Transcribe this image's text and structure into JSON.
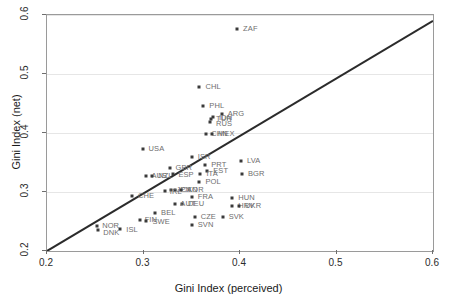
{
  "chart_data": {
    "type": "scatter",
    "title": "",
    "xlabel": "Gini Index (perceived)",
    "ylabel": "Gini Index (net)",
    "xlim": [
      0.2,
      0.6
    ],
    "ylim": [
      0.2,
      0.6
    ],
    "xticks": [
      "0.2",
      "0.3",
      "0.4",
      "0.5",
      "0.6"
    ],
    "yticks": [
      "0.2",
      "0.3",
      "0.4",
      "0.5",
      "0.6"
    ],
    "xtick_values": [
      0.2,
      0.3,
      0.4,
      0.5,
      0.6
    ],
    "ytick_values": [
      0.2,
      0.3,
      0.4,
      0.5,
      0.6
    ],
    "grid": "horizontal",
    "legend": "none",
    "marker_color": "#3a3a3a",
    "label_color": "#6e6e6e",
    "gridline_color": "#e6e6e6",
    "reference_line": {
      "name": "identity-line",
      "type": "45-degree",
      "from": [
        0.2,
        0.2
      ],
      "to": [
        0.6,
        0.59
      ],
      "color": "#2b2b2b"
    },
    "points": [
      {
        "label": "ZAF",
        "x": 0.397,
        "y": 0.576,
        "lx": 6,
        "ly": -4
      },
      {
        "label": "CHL",
        "x": 0.358,
        "y": 0.478,
        "lx": 6,
        "ly": -4
      },
      {
        "label": "PHL",
        "x": 0.362,
        "y": 0.446,
        "lx": 6,
        "ly": -4
      },
      {
        "label": "ARG",
        "x": 0.381,
        "y": 0.432,
        "lx": 6,
        "ly": -4
      },
      {
        "label": "IDN",
        "x": 0.372,
        "y": 0.427,
        "lx": 6,
        "ly": -3
      },
      {
        "label": "TUR",
        "x": 0.37,
        "y": 0.424,
        "lx": 5,
        "ly": -4
      },
      {
        "label": "RUS",
        "x": 0.369,
        "y": 0.419,
        "lx": 6,
        "ly": -2
      },
      {
        "label": "CHN",
        "x": 0.365,
        "y": 0.398,
        "lx": 5,
        "ly": -4
      },
      {
        "label": "MEX",
        "x": 0.371,
        "y": 0.398,
        "lx": 6,
        "ly": -4
      },
      {
        "label": "USA",
        "x": 0.299,
        "y": 0.373,
        "lx": 6,
        "ly": -4
      },
      {
        "label": "ISR",
        "x": 0.35,
        "y": 0.36,
        "lx": 6,
        "ly": -4
      },
      {
        "label": "LVA",
        "x": 0.401,
        "y": 0.352,
        "lx": 6,
        "ly": -4
      },
      {
        "label": "PRT",
        "x": 0.364,
        "y": 0.345,
        "lx": 6,
        "ly": -4
      },
      {
        "label": "GBR",
        "x": 0.327,
        "y": 0.341,
        "lx": 6,
        "ly": -4
      },
      {
        "label": "EST",
        "x": 0.366,
        "y": 0.336,
        "lx": 6,
        "ly": -4
      },
      {
        "label": "ITA",
        "x": 0.359,
        "y": 0.331,
        "lx": 6,
        "ly": -4
      },
      {
        "label": "BGR",
        "x": 0.402,
        "y": 0.33,
        "lx": 6,
        "ly": -4
      },
      {
        "label": "ESP",
        "x": 0.331,
        "y": 0.331,
        "lx": 5,
        "ly": -3
      },
      {
        "label": "AUS",
        "x": 0.303,
        "y": 0.327,
        "lx": 5,
        "ly": -4
      },
      {
        "label": "NZL",
        "x": 0.309,
        "y": 0.327,
        "lx": 6,
        "ly": -4
      },
      {
        "label": "POL",
        "x": 0.358,
        "y": 0.317,
        "lx": 6,
        "ly": -4
      },
      {
        "label": "JPN",
        "x": 0.329,
        "y": 0.303,
        "lx": 5,
        "ly": -4
      },
      {
        "label": "CAN",
        "x": 0.333,
        "y": 0.303,
        "lx": 6,
        "ly": -4
      },
      {
        "label": "KOR",
        "x": 0.339,
        "y": 0.303,
        "lx": 6,
        "ly": -4
      },
      {
        "label": "IRL",
        "x": 0.322,
        "y": 0.302,
        "lx": 5,
        "ly": -3
      },
      {
        "label": "CHE",
        "x": 0.288,
        "y": 0.294,
        "lx": 6,
        "ly": -4
      },
      {
        "label": "FRA",
        "x": 0.35,
        "y": 0.291,
        "lx": 6,
        "ly": -4
      },
      {
        "label": "HUN",
        "x": 0.392,
        "y": 0.289,
        "lx": 6,
        "ly": -4
      },
      {
        "label": "DEU",
        "x": 0.34,
        "y": 0.28,
        "lx": 6,
        "ly": -4
      },
      {
        "label": "AUT",
        "x": 0.333,
        "y": 0.279,
        "lx": 5,
        "ly": -4
      },
      {
        "label": "HRV",
        "x": 0.392,
        "y": 0.277,
        "lx": 6,
        "ly": -4
      },
      {
        "label": "UKR",
        "x": 0.399,
        "y": 0.277,
        "lx": 6,
        "ly": -4
      },
      {
        "label": "BEL",
        "x": 0.312,
        "y": 0.264,
        "lx": 6,
        "ly": -4
      },
      {
        "label": "CZE",
        "x": 0.353,
        "y": 0.257,
        "lx": 6,
        "ly": -4
      },
      {
        "label": "SVK",
        "x": 0.382,
        "y": 0.257,
        "lx": 6,
        "ly": -4
      },
      {
        "label": "FIN",
        "x": 0.296,
        "y": 0.253,
        "lx": 5,
        "ly": -4
      },
      {
        "label": "SWE",
        "x": 0.303,
        "y": 0.251,
        "lx": 6,
        "ly": -3
      },
      {
        "label": "SVN",
        "x": 0.35,
        "y": 0.244,
        "lx": 6,
        "ly": -4
      },
      {
        "label": "NOR",
        "x": 0.252,
        "y": 0.243,
        "lx": 5,
        "ly": -4
      },
      {
        "label": "ISL",
        "x": 0.276,
        "y": 0.237,
        "lx": 6,
        "ly": -3
      },
      {
        "label": "DNK",
        "x": 0.253,
        "y": 0.236,
        "lx": 5,
        "ly": -1
      }
    ]
  }
}
